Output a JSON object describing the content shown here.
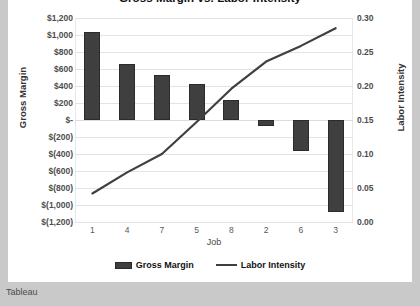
{
  "title": "Gross Margin vs. Labor Intensity",
  "footer": {
    "label": "Tableau"
  },
  "legend": {
    "position": "bottom",
    "items": [
      {
        "name": "Gross Margin",
        "marker": "bar",
        "color": "#3f3f3f"
      },
      {
        "name": "Labor Intensity",
        "marker": "line",
        "color": "#3f3f3f"
      }
    ]
  },
  "axes": {
    "x": {
      "label": "Job"
    },
    "y_left": {
      "label": "Gross Margin",
      "ticks": [
        "$1,200",
        "$1,000",
        "$800",
        "$600",
        "$400",
        "$200",
        "$-",
        "$(200)",
        "$(400)",
        "$(600)",
        "$(800)",
        "$(1,000)",
        "$(1,200)"
      ]
    },
    "y_right": {
      "label": "Labor Intensity",
      "ticks": [
        "0.30",
        "0.25",
        "0.20",
        "0.15",
        "0.10",
        "0.05",
        "0.00"
      ]
    }
  },
  "chart_data": {
    "type": "bar",
    "title": "Gross Margin vs. Labor Intensity",
    "xlabel": "Job",
    "ylabel": "Gross Margin",
    "y2label": "Labor Intensity",
    "categories": [
      "1",
      "4",
      "7",
      "5",
      "8",
      "2",
      "6",
      "3"
    ],
    "ylim": [
      -1200,
      1200
    ],
    "y2lim": [
      0.0,
      0.3
    ],
    "grid": true,
    "series": [
      {
        "name": "Gross Margin",
        "type": "bar",
        "axis": "left",
        "color": "#3f3f3f",
        "values": [
          1040,
          660,
          530,
          420,
          240,
          -70,
          -360,
          -1080
        ]
      },
      {
        "name": "Labor Intensity",
        "type": "line",
        "axis": "right",
        "color": "#3f3f3f",
        "values": [
          0.042,
          0.073,
          0.1,
          0.147,
          0.196,
          0.236,
          0.259,
          0.285
        ]
      }
    ]
  }
}
